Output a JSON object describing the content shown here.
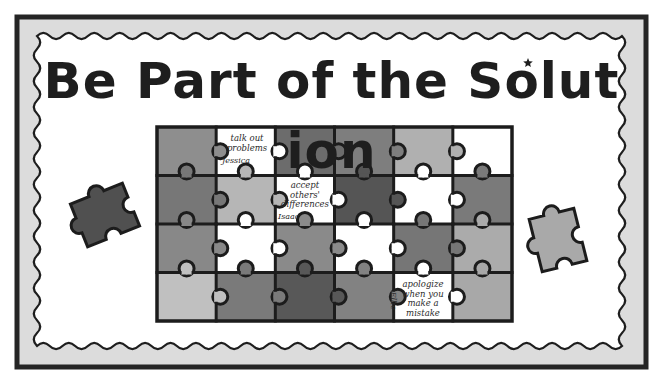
{
  "title": {
    "before_star": "Be Part of the Solut",
    "star_letter": "i",
    "after_star": "on",
    "full_text": "Be Part of the Solution"
  },
  "colors": {
    "frame_border": "#252525",
    "frame_band": "#dcdcdc",
    "inner_bg": "#ffffff",
    "piece_outline": "#1c1c1c",
    "loose_left": "#505050",
    "loose_right": "#a9a9a9"
  },
  "puzzle_grid": {
    "rows": 4,
    "cols": 6,
    "cells": [
      [
        "#8e8e8e",
        "#ffffff",
        "#6c6c6c",
        "#7e7e7e",
        "#b0b0b0",
        "#ffffff"
      ],
      [
        "#777777",
        "#b6b6b6",
        "#ffffff",
        "#555555",
        "#ffffff",
        "#7a7a7a"
      ],
      [
        "#888888",
        "#ffffff",
        "#8a8a8a",
        "#ffffff",
        "#767676",
        "#ababab"
      ],
      [
        "#c0c0c0",
        "#7a7a7a",
        "#585858",
        "#828282",
        "#ffffff",
        "#a8a8a8"
      ]
    ]
  },
  "notes": [
    {
      "lines": [
        "talk out",
        "problems"
      ],
      "name": "Jessica",
      "row": 0,
      "col": 1
    },
    {
      "lines": [
        "accept",
        "others'",
        "differences"
      ],
      "name": "Isaac",
      "row": 1,
      "col": 2
    },
    {
      "lines": [
        "apologize",
        "when you",
        "make a",
        "mistake"
      ],
      "name": "Ellie",
      "row": 3,
      "col": 4
    }
  ],
  "loose_pieces": [
    {
      "side": "left",
      "shade": "dark"
    },
    {
      "side": "right",
      "shade": "light"
    }
  ]
}
